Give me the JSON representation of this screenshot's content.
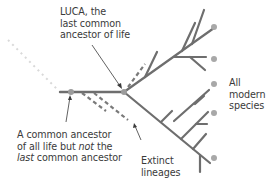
{
  "diagram": {
    "title": "",
    "colors": {
      "branch": "#6e6e6e",
      "extinct": "#7a7a7a",
      "tip_dot": "#a8a8a8",
      "node_dot": "#9c9c9c",
      "faded_trail": "#d6d6d6",
      "text": "#3a3a3a"
    },
    "labels": {
      "luca": {
        "line1": "LUCA, the",
        "line2": "last common",
        "line3": "ancestor of life"
      },
      "common_ancestor": {
        "line1": "A common ancestor",
        "line2_prefix": "of all life but ",
        "line2_italic": "not",
        "line2_suffix": " the",
        "line3_italic": "last",
        "line3_suffix": " common ancestor"
      },
      "extinct": {
        "line1": "Extinct",
        "line2": "lineages"
      },
      "modern": {
        "line1": "All",
        "line2": "modern",
        "line3": "species"
      }
    },
    "nodes": [
      {
        "id": "common-ancestor",
        "x": 71,
        "y": 92
      },
      {
        "id": "luca",
        "x": 124,
        "y": 92
      }
    ],
    "modern_species_tips": 5,
    "extinct_lineages": 3
  }
}
